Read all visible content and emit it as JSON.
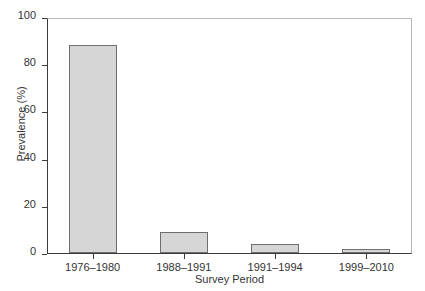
{
  "chart_data": {
    "type": "bar",
    "title": "",
    "subtitle": "",
    "categories": [
      "1976–1980",
      "1988–1991",
      "1991–1994",
      "1999–2010"
    ],
    "values": [
      88,
      9,
      4,
      1.5
    ],
    "xlabel": "Survey Period",
    "ylabel": "Prevalence (%)",
    "ylim": [
      0,
      100
    ],
    "yticks": [
      0,
      20,
      40,
      60,
      80,
      100
    ],
    "ytick_labels": [
      "0",
      "20",
      "40",
      "60",
      "80",
      "100"
    ],
    "grid": false,
    "legend": null,
    "annotations": [],
    "style": {
      "bar_fill": "#d6d6d6",
      "bar_edge": "#6e6e6e",
      "axis_color": "#3b3b3b",
      "frame_color": "#b9b9b9",
      "text_color": "#333333",
      "background": "#ffffff"
    }
  }
}
